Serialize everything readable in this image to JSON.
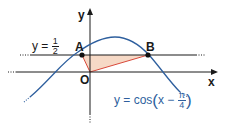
{
  "diagram": {
    "axes": {
      "x_label": "x",
      "y_label": "y",
      "origin_label": "O"
    },
    "horizontal_line": {
      "label_prefix": "y =",
      "numerator": "1",
      "denominator": "2"
    },
    "points": [
      {
        "label": "A"
      },
      {
        "label": "B"
      }
    ],
    "curve": {
      "label_prefix": "y = cos",
      "inner_prefix": "x −",
      "numerator": "π",
      "denominator": "4"
    },
    "colors": {
      "curve": "#2e5f9e",
      "triangle_fill": "#f6d9c6",
      "triangle_edge": "#d9493b",
      "axes": "#1a1a1a"
    }
  }
}
